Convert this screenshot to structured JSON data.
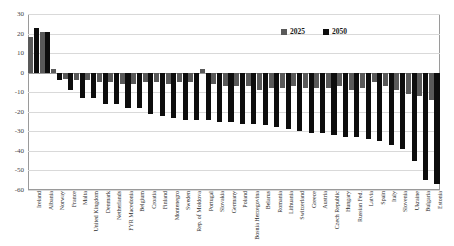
{
  "chart_data": {
    "type": "bar",
    "title": "",
    "subtitle": "",
    "xlabel": "",
    "ylabel": "",
    "ylim": [
      -60,
      30
    ],
    "ytick_step": 10,
    "yticks": [
      30,
      20,
      10,
      0,
      -10,
      -20,
      -30,
      -40,
      -50,
      -60
    ],
    "grid": true,
    "legend_position": "top-right-inside",
    "colors": {
      "2025": "#595959",
      "2050": "#0d0d0d",
      "gridline": "#d9d9d9",
      "axis": "#9a9a9a"
    },
    "categories": [
      "Ireland",
      "Albania",
      "Norway",
      "France",
      "Malta",
      "United Kingdom",
      "Denmark",
      "Netherlands",
      "FYR Macedonia",
      "Belgium",
      "Croatia",
      "Finland",
      "Montenegro",
      "Sweden",
      "Rep. of Moldova",
      "Portugal",
      "Slovakia",
      "Germany",
      "Poland",
      "Bosnia Herzegovina",
      "Belarus",
      "Romania",
      "Lithuania",
      "Switzerland",
      "Greece",
      "Austria",
      "Czech Republic",
      "Hungary",
      "Russian Fed.",
      "Latvia",
      "Spain",
      "Italy",
      "Slovenia",
      "Ukraine",
      "Bulgaria",
      "Estonia"
    ],
    "series": [
      {
        "name": "2025",
        "color": "#595959",
        "values": [
          18,
          21,
          2,
          -3,
          -4,
          -4,
          -5,
          -5,
          -6,
          -6,
          -5,
          -5,
          -6,
          -5,
          -5,
          2,
          -6,
          -7,
          -7,
          -7,
          -9,
          -8,
          -8,
          -7,
          -8,
          -8,
          -8,
          -7,
          -9,
          -8,
          -5,
          -7,
          -9,
          -11,
          -12,
          -14
        ]
      },
      {
        "name": "2050",
        "color": "#0d0d0d",
        "values": [
          23,
          21,
          -4,
          -9,
          -13,
          -13,
          -16,
          -16,
          -18,
          -18,
          -21,
          -22,
          -23,
          -24,
          -24,
          -24,
          -25,
          -25,
          -26,
          -26,
          -27,
          -28,
          -29,
          -30,
          -31,
          -31,
          -32,
          -33,
          -33,
          -34,
          -35,
          -37,
          -39,
          -45,
          -55,
          -57
        ]
      }
    ]
  },
  "legend": {
    "items": [
      {
        "label": "2025",
        "swatch": "legend-swatch-2025"
      },
      {
        "label": "2050",
        "swatch": "legend-swatch-2050"
      }
    ]
  }
}
